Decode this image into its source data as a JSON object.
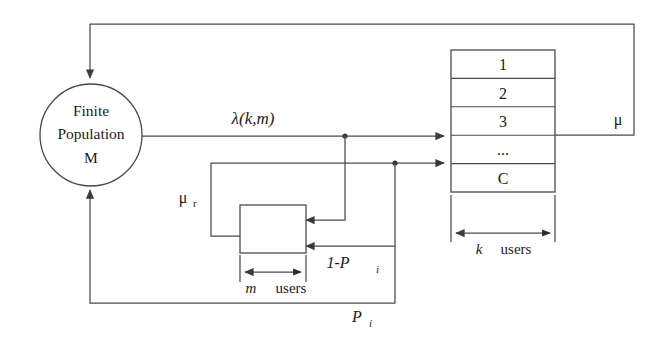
{
  "diagram": {
    "colors": {
      "line": "#4a4a4a",
      "text": "#1b1b1b",
      "background": "#ffffff",
      "dot": "#3a3a3a"
    },
    "source_node": {
      "name": "finite-population",
      "line1": "Finite",
      "line2": "Population",
      "line3": "M"
    },
    "server": {
      "name": "server-queue",
      "cells": [
        "1",
        "2",
        "3",
        "...",
        "C"
      ],
      "capacity_label": "C",
      "dimension_label_k": "k",
      "dimension_label_users": "users"
    },
    "retrial_box": {
      "name": "retrial-orbit",
      "dimension_label_m": "m",
      "dimension_label_users": "users"
    },
    "labels": {
      "arrival_rate": "λ(k,m)",
      "service_rate": "μ",
      "retrial_rate": "μ",
      "retrial_rate_sub": "r",
      "blocking_prob": "1-P",
      "blocking_prob_sub": "i",
      "success_prob": "P",
      "success_prob_sub": "i"
    }
  }
}
